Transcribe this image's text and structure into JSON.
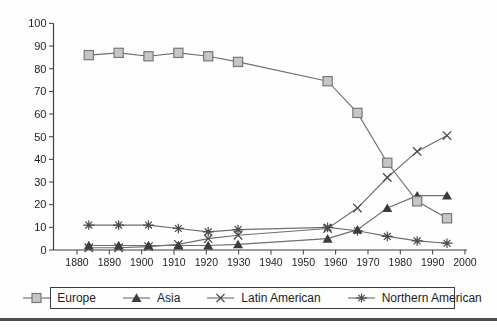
{
  "chart_data": {
    "type": "line",
    "title": "",
    "xlabel": "",
    "ylabel": "",
    "x": [
      1880,
      1890,
      1900,
      1910,
      1920,
      1930,
      1960,
      1970,
      1980,
      1990,
      2000
    ],
    "series": [
      {
        "name": "Europe",
        "marker": "square",
        "values": [
          86,
          87,
          85.5,
          87,
          85.5,
          83,
          74.5,
          60.5,
          38.5,
          21.5,
          14
        ]
      },
      {
        "name": "Asia",
        "marker": "triangle",
        "values": [
          2,
          2,
          2,
          2,
          2,
          2.5,
          5,
          9,
          18.5,
          24,
          24
        ]
      },
      {
        "name": "Latin American",
        "marker": "x-cross",
        "values": [
          1,
          1,
          1.5,
          2.5,
          5,
          6.5,
          9.5,
          18.5,
          32,
          43.5,
          50.5
        ]
      },
      {
        "name": "Northern American",
        "marker": "asterisk",
        "values": [
          11,
          11,
          11,
          9.5,
          8,
          9,
          10,
          8.5,
          6,
          4,
          3
        ]
      }
    ],
    "x_tick_labels": [
      "1880",
      "1890",
      "1900",
      "1910",
      "1920",
      "1930",
      "1940",
      "1950",
      "1960",
      "1970",
      "1980",
      "1990",
      "2000"
    ],
    "y_tick_labels": [
      "0",
      "10",
      "20",
      "30",
      "40",
      "50",
      "60",
      "70",
      "80",
      "90",
      "100"
    ],
    "y_ticks": [
      0,
      10,
      20,
      30,
      40,
      50,
      60,
      70,
      80,
      90,
      100
    ],
    "ylim": [
      0,
      100
    ],
    "xlim": [
      1880,
      2000
    ],
    "grid": false,
    "legend_position": "bottom"
  },
  "colors": {
    "line": "#6e6e6e",
    "axis": "#3f3f3f",
    "square_fill": "#c6c6c6",
    "square_stroke": "#787878",
    "triangle_fill": "#3c3c3c",
    "marker_stroke": "#4a4a4a",
    "text": "#1d1d1d",
    "rule": "#4d4d4d"
  }
}
